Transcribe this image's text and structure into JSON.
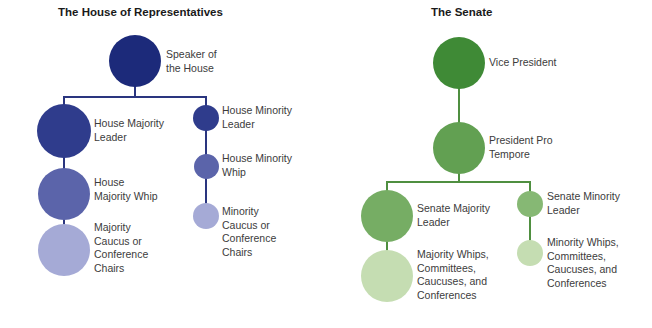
{
  "house": {
    "title": "The House of Representatives",
    "line_color": "#2a357f",
    "nodes": {
      "speaker": {
        "label": "Speaker of the House",
        "lines": [
          "Speaker of",
          "the House"
        ],
        "color": "#1c2a7a"
      },
      "majority_leader": {
        "label": "House Majority Leader",
        "lines": [
          "House Majority",
          "Leader"
        ],
        "color": "#2f3c8c"
      },
      "majority_whip": {
        "label": "House Majority Whip",
        "lines": [
          "House",
          "Majority Whip"
        ],
        "color": "#5b64aa"
      },
      "majority_caucus": {
        "label": "Majority Caucus or Conference Chairs",
        "lines": [
          "Majority",
          "Caucus or",
          "Conference",
          "Chairs"
        ],
        "color": "#a5aad6"
      },
      "minority_leader": {
        "label": "House Minority Leader",
        "lines": [
          "House Minority",
          "Leader"
        ],
        "color": "#2f3c8c"
      },
      "minority_whip": {
        "label": "House Minority Whip",
        "lines": [
          "House Minority",
          "Whip"
        ],
        "color": "#5b64aa"
      },
      "minority_caucus": {
        "label": "Minority Caucus or Conference Chairs",
        "lines": [
          "Minority",
          "Caucus or",
          "Conference",
          "Chairs"
        ],
        "color": "#a5aad6"
      }
    }
  },
  "senate": {
    "title": "The Senate",
    "line_color": "#4f8f40",
    "nodes": {
      "vice_president": {
        "label": "Vice President",
        "lines": [
          "Vice President"
        ],
        "color": "#3f8a36"
      },
      "pro_tempore": {
        "label": "President Pro Tempore",
        "lines": [
          "President Pro",
          "Tempore"
        ],
        "color": "#62a052"
      },
      "majority_leader": {
        "label": "Senate Majority Leader",
        "lines": [
          "Senate Majority",
          "Leader"
        ],
        "color": "#76ad64"
      },
      "majority_whips": {
        "label": "Majority Whips, Committees, Caucuses, and Conferences",
        "lines": [
          "Majority Whips,",
          "Committees,",
          "Caucuses, and",
          "Conferences"
        ],
        "color": "#c5ddb2"
      },
      "minority_leader": {
        "label": "Senate Minority Leader",
        "lines": [
          "Senate Minority",
          "Leader"
        ],
        "color": "#86b874"
      },
      "minority_whips": {
        "label": "Minority Whips, Committees, Caucuses, and Conferences",
        "lines": [
          "Minority Whips,",
          "Committees,",
          "Caucuses, and",
          "Conferences"
        ],
        "color": "#c5ddb2"
      }
    }
  }
}
